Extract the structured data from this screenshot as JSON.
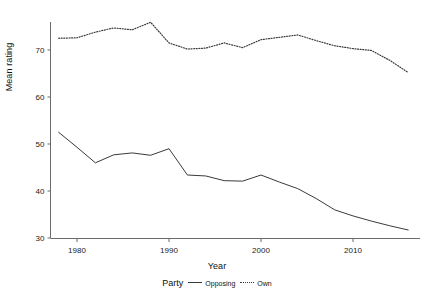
{
  "chart_data": {
    "type": "line",
    "title": "",
    "xlabel": "Year",
    "ylabel": "Mean rating",
    "xlim": [
      1977,
      2016
    ],
    "ylim": [
      30,
      76
    ],
    "xticks": [
      1980,
      1990,
      2000,
      2010
    ],
    "yticks": [
      30,
      40,
      50,
      60,
      70
    ],
    "grid": false,
    "legend_title": "Party",
    "legend_position": "bottom",
    "series": [
      {
        "name": "Opposing",
        "style": "solid",
        "color": "#3a3a3a",
        "x": [
          1978,
          1980,
          1982,
          1984,
          1986,
          1988,
          1990,
          1992,
          1994,
          1996,
          1998,
          2000,
          2002,
          2004,
          2006,
          2008,
          2010,
          2012,
          2014,
          2016
        ],
        "values": [
          52.5,
          49.3,
          46.0,
          47.7,
          48.1,
          47.6,
          49.0,
          43.4,
          43.2,
          42.2,
          42.1,
          43.4,
          41.9,
          40.5,
          38.4,
          36.0,
          34.7,
          33.6,
          32.6,
          31.7
        ]
      },
      {
        "name": "Own",
        "style": "dotted",
        "color": "#3a3a3a",
        "x": [
          1978,
          1980,
          1982,
          1984,
          1986,
          1988,
          1990,
          1992,
          1994,
          1996,
          1998,
          2000,
          2002,
          2004,
          2006,
          2008,
          2010,
          2012,
          2014,
          2016
        ],
        "values": [
          72.5,
          72.6,
          73.8,
          74.7,
          74.3,
          75.9,
          71.5,
          70.2,
          70.4,
          71.5,
          70.5,
          72.2,
          72.7,
          73.2,
          72.0,
          70.9,
          70.3,
          69.9,
          67.8,
          65.2
        ]
      }
    ]
  },
  "legend": {
    "title": "Party",
    "entries": [
      {
        "label": "Opposing",
        "style": "solid"
      },
      {
        "label": "Own",
        "style": "dotted"
      }
    ]
  },
  "axes": {
    "x_title": "Year",
    "y_title": "Mean rating"
  }
}
